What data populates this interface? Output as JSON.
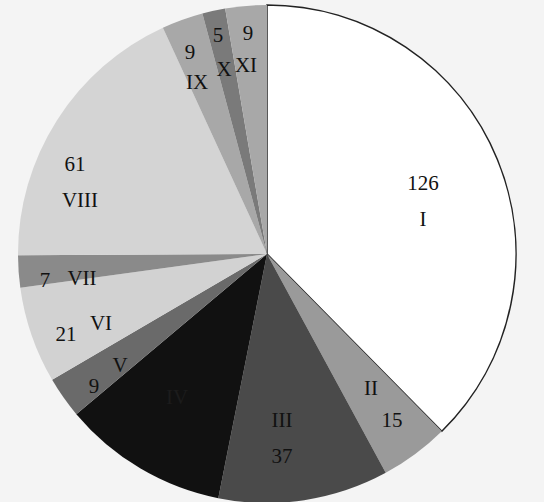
{
  "chart_data": {
    "type": "pie",
    "title": "",
    "start_angle_deg": 0,
    "direction": "clockwise",
    "slices": [
      {
        "label": "I",
        "value": 126,
        "color": "#ffffff",
        "value_shown": true
      },
      {
        "label": "II",
        "value": 15,
        "color": "#9a9a9a",
        "value_shown": true
      },
      {
        "label": "III",
        "value": 37,
        "color": "#4a4a4a",
        "value_shown": true
      },
      {
        "label": "IV",
        "value": 36,
        "color": "#111111",
        "value_shown": false
      },
      {
        "label": "V",
        "value": 9,
        "color": "#6a6a6a",
        "value_shown": true
      },
      {
        "label": "VI",
        "value": 21,
        "color": "#d2d2d2",
        "value_shown": true
      },
      {
        "label": "VII",
        "value": 7,
        "color": "#8a8a8a",
        "value_shown": true
      },
      {
        "label": "VIII",
        "value": 61,
        "color": "#d4d4d4",
        "value_shown": true
      },
      {
        "label": "IX",
        "value": 9,
        "color": "#a8a8a8",
        "value_shown": true
      },
      {
        "label": "X",
        "value": 5,
        "color": "#7a7a7a",
        "value_shown": true
      },
      {
        "label": "XI",
        "value": 9,
        "color": "#a8a8a8",
        "value_shown": true
      }
    ],
    "labels": {
      "I": {
        "value_text": "126",
        "roman": "I",
        "vx": 423,
        "vy": 190,
        "rx": 423,
        "ry": 226
      },
      "II": {
        "value_text": "15",
        "roman": "II",
        "vx": 392,
        "vy": 427,
        "rx": 371,
        "ry": 395
      },
      "III": {
        "value_text": "37",
        "roman": "III",
        "vx": 282,
        "vy": 463,
        "rx": 282,
        "ry": 427
      },
      "IV": {
        "value_text": "",
        "roman": "IV",
        "vx": 0,
        "vy": 0,
        "rx": 177,
        "ry": 404
      },
      "V": {
        "value_text": "9",
        "roman": "V",
        "vx": 94,
        "vy": 393,
        "rx": 120,
        "ry": 372
      },
      "VI": {
        "value_text": "21",
        "roman": "VI",
        "vx": 66,
        "vy": 341,
        "rx": 101,
        "ry": 330
      },
      "VII": {
        "value_text": "7",
        "roman": "VII",
        "vx": 45,
        "vy": 287,
        "rx": 82,
        "ry": 285
      },
      "VIII": {
        "value_text": "61",
        "roman": "VIII",
        "vx": 75,
        "vy": 171,
        "rx": 80,
        "ry": 207
      },
      "IX": {
        "value_text": "9",
        "roman": "IX",
        "vx": 190,
        "vy": 59,
        "rx": 197,
        "ry": 89
      },
      "X": {
        "value_text": "5",
        "roman": "X",
        "vx": 218,
        "vy": 42,
        "rx": 224,
        "ry": 76
      },
      "XI": {
        "value_text": "9",
        "roman": "XI",
        "vx": 248,
        "vy": 40,
        "rx": 246,
        "ry": 72
      }
    },
    "legend": null,
    "annotations": []
  }
}
